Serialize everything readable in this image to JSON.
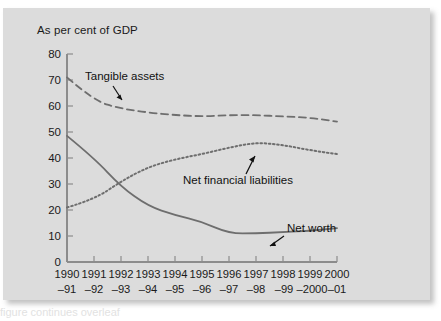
{
  "panel": {
    "background_color": "#dcdcdc",
    "page_background_color": "#ffffff"
  },
  "caption_bleed": {
    "text": "figure continues overleaf"
  },
  "chart_data": {
    "type": "line",
    "title": "As per cent of GDP",
    "xlabel": "",
    "ylabel": "",
    "ylim": [
      0,
      80
    ],
    "ytick_step": 10,
    "grid": false,
    "legend_position": "inline-annotations",
    "axis_color": "#8c8c8c",
    "series_color": "#6e6e6e",
    "categories": [
      "1990–91",
      "1991–92",
      "1992–93",
      "1993–94",
      "1994–95",
      "1995–96",
      "1996–97",
      "1997–98",
      "1998–99",
      "1999–2000",
      "2000–01"
    ],
    "category_top_labels": [
      "1990",
      "1991",
      "1992",
      "1993",
      "1994",
      "1995",
      "1996",
      "1997",
      "1998",
      "1999",
      "2000"
    ],
    "category_bottom_labels": [
      "–91",
      "–92",
      "–93",
      "–94",
      "–95",
      "–96",
      "–97",
      "–98",
      "–99",
      "–2000",
      "–01"
    ],
    "ytick_labels": [
      "0",
      "10",
      "20",
      "30",
      "40",
      "50",
      "60",
      "70",
      "80"
    ],
    "ytick_values": [
      0,
      10,
      20,
      30,
      40,
      50,
      60,
      70,
      80
    ],
    "series": [
      {
        "name": "Tangible assets",
        "style": "dashed",
        "values": [
          71,
          62,
          59,
          57.5,
          56.5,
          56,
          56.5,
          56.5,
          56,
          55.5,
          54
        ]
      },
      {
        "name": "Net financial liabilities",
        "style": "dotted",
        "values": [
          21,
          24,
          31,
          36.5,
          39.5,
          41.5,
          44,
          46,
          45,
          43,
          41.5
        ]
      },
      {
        "name": "Net worth",
        "style": "solid",
        "values": [
          48.5,
          40,
          29,
          21.5,
          18,
          15.5,
          11,
          11,
          11.5,
          12,
          13
        ]
      }
    ],
    "annotations": [
      {
        "label": "Tangible assets",
        "points_to_series": "Tangible assets"
      },
      {
        "label": "Net financial liabilities",
        "points_to_series": "Net financial liabilities"
      },
      {
        "label": "Net worth",
        "points_to_series": "Net worth"
      }
    ]
  }
}
